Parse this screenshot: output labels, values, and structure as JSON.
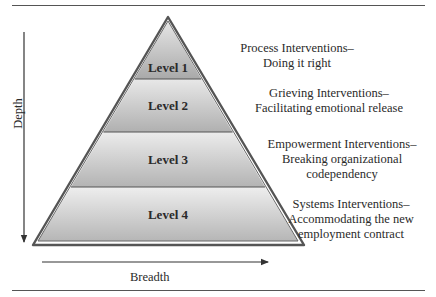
{
  "diagram": {
    "type": "pyramid",
    "levels": [
      {
        "label": "Level 1",
        "title": "Process Interventions–",
        "subtitle_lines": [
          "Doing it right"
        ]
      },
      {
        "label": "Level 2",
        "title": "Grieving Interventions–",
        "subtitle_lines": [
          "Facilitating emotional release"
        ]
      },
      {
        "label": "Level 3",
        "title": "Empowerment Interventions–",
        "subtitle_lines": [
          "Breaking organizational",
          "codependency"
        ]
      },
      {
        "label": "Level 4",
        "title": "Systems Interventions–",
        "subtitle_lines": [
          "Accommodating the new",
          "employment contract"
        ]
      }
    ],
    "axes": {
      "vertical": {
        "label": "Depth",
        "direction": "down"
      },
      "horizontal": {
        "label": "Breadth",
        "direction": "right"
      }
    },
    "colors": {
      "fill_light": "#e4e4e4",
      "fill_dark": "#b4b4b4",
      "outline": "#555555",
      "text": "#2a2a2a"
    }
  }
}
